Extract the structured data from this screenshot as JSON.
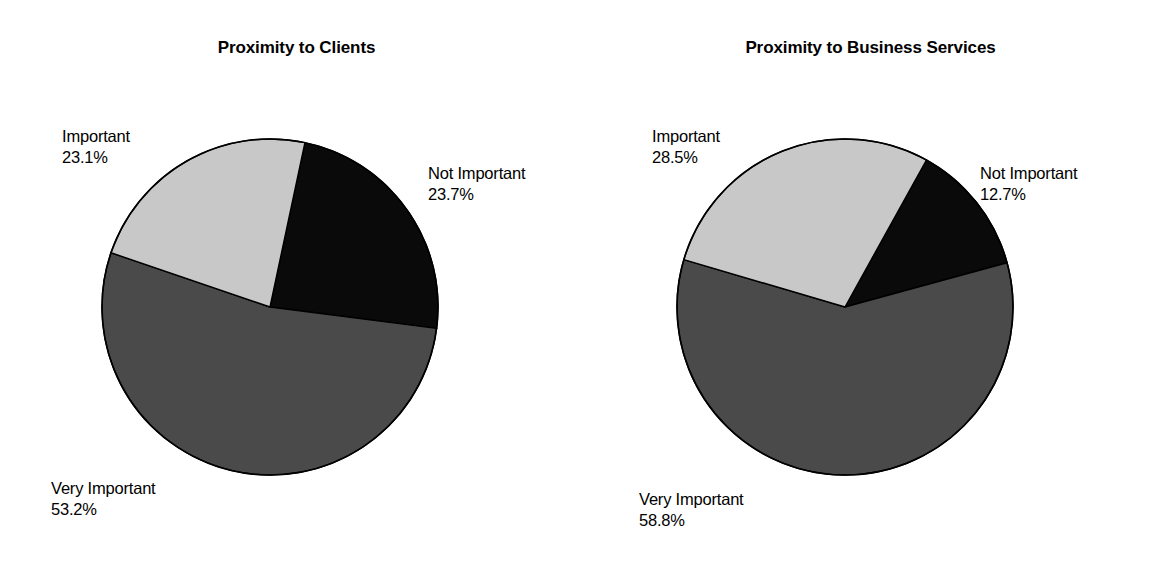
{
  "figure": {
    "background": "#ffffff",
    "panel_count": 2
  },
  "colors": {
    "not_important": "#0a0a0a",
    "important": "#c8c8c8",
    "very_important": "#4a4a4a",
    "outline": "#000000",
    "text": "#000000"
  },
  "panels": [
    {
      "id": "proximity-to-clients",
      "title": "Proximity to Clients",
      "labels": {
        "important": {
          "name": "Important",
          "pct": "23.1%"
        },
        "not_important": {
          "name": "Not Important",
          "pct": "23.7%"
        },
        "very_important": {
          "name": "Very Important",
          "pct": "53.2%"
        }
      }
    },
    {
      "id": "proximity-to-business-services",
      "title": "Proximity to Business Services",
      "labels": {
        "important": {
          "name": "Important",
          "pct": "28.5%"
        },
        "not_important": {
          "name": "Not Important",
          "pct": "12.7%"
        },
        "very_important": {
          "name": "Very Important",
          "pct": "58.8%"
        }
      }
    }
  ],
  "chart_data": [
    {
      "type": "pie",
      "title": "Proximity to Clients",
      "labels": [
        "Not Important",
        "Very Important",
        "Important"
      ],
      "values": [
        23.7,
        53.2,
        23.1
      ],
      "value_unit": "percent",
      "colors": [
        "#0a0a0a",
        "#4a4a4a",
        "#c8c8c8"
      ],
      "start_angle_deg_cw_from_top": 12,
      "direction": "clockwise",
      "data_labels": [
        "23.7%",
        "53.2%",
        "23.1%"
      ],
      "legend": "none",
      "grid": false
    },
    {
      "type": "pie",
      "title": "Proximity to Business Services",
      "labels": [
        "Not Important",
        "Very Important",
        "Important"
      ],
      "values": [
        12.7,
        58.8,
        28.5
      ],
      "value_unit": "percent",
      "colors": [
        "#0a0a0a",
        "#4a4a4a",
        "#c8c8c8"
      ],
      "start_angle_deg_cw_from_top": 29,
      "direction": "clockwise",
      "data_labels": [
        "12.7%",
        "58.8%",
        "28.5%"
      ],
      "legend": "none",
      "grid": false
    }
  ]
}
